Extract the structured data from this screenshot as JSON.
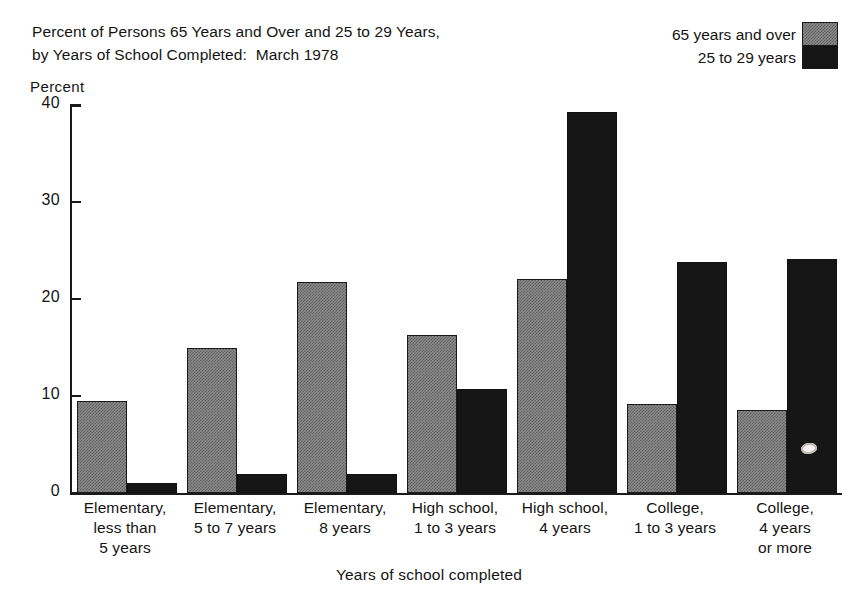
{
  "chart_data": {
    "type": "bar",
    "title": "Percent of Persons 65 Years and Over and 25 to 29 Years, by Years of School Completed:  March 1978",
    "title_lines": [
      "Percent of Persons 65 Years and Over and 25 to 29 Years,",
      "by Years of School Completed:  March 1978"
    ],
    "xlabel": "Years of school completed",
    "ylabel": "Percent",
    "ylim": [
      0,
      40
    ],
    "yticks": [
      0,
      10,
      20,
      30,
      40
    ],
    "ytick_labels": [
      "0",
      "10",
      "20",
      "30",
      "40"
    ],
    "grid": false,
    "legend_position": "top-right",
    "categories": [
      "Elementary, less than 5 years",
      "Elementary, 5 to 7 years",
      "Elementary, 8 years",
      "High school, 1 to 3 years",
      "High school, 4 years",
      "College, 1 to 3 years",
      "College, 4 years or more"
    ],
    "category_lines": [
      [
        "Elementary,",
        "less than",
        "5 years"
      ],
      [
        "Elementary,",
        "5 to 7 years"
      ],
      [
        "Elementary,",
        "8 years"
      ],
      [
        "High school,",
        "1 to 3 years"
      ],
      [
        "High school,",
        "4 years"
      ],
      [
        "College,",
        "1 to 3 years"
      ],
      [
        "College,",
        "4 years",
        "or more"
      ]
    ],
    "series": [
      {
        "name": "65 years and over",
        "color": "#8a8a8a",
        "pattern": "gray-dither",
        "values": [
          9.5,
          14.9,
          21.8,
          16.3,
          22.1,
          9.2,
          8.6
        ]
      },
      {
        "name": "25 to 29 years",
        "color": "#161616",
        "pattern": "solid-black",
        "values": [
          1.0,
          2.0,
          2.0,
          10.7,
          39.3,
          23.8,
          24.1
        ]
      }
    ]
  },
  "legend": {
    "items": [
      {
        "label": "65 years and over",
        "swatch": "gray-dither"
      },
      {
        "label": "25 to 29 years",
        "swatch": "solid-black"
      }
    ]
  },
  "annotations": [
    {
      "name": "white-oval-blemish",
      "series": "25 to 29 years",
      "category_index": 6,
      "approx_value": 4.5
    }
  ]
}
